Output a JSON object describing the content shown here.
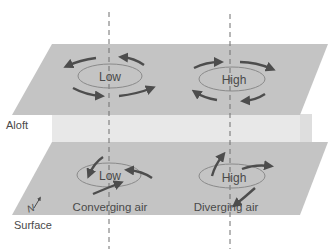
{
  "diagram": {
    "levels": {
      "aloft": "Aloft",
      "surface": "Surface"
    },
    "aloft_plane": {
      "low_label": "Low",
      "high_label": "High"
    },
    "surface_plane": {
      "low_label": "Low",
      "high_label": "High",
      "low_caption": "Converging air",
      "high_caption": "Diverging air"
    },
    "compass": {
      "north_label": "N"
    },
    "colors": {
      "plane": "#c4c4c4",
      "gap": "#e6e6e6",
      "arrow": "#4d4d4d",
      "ellipse": "#8a8a8a",
      "dashed_line": "#6e6e6e",
      "text": "#4a4a4a"
    }
  }
}
